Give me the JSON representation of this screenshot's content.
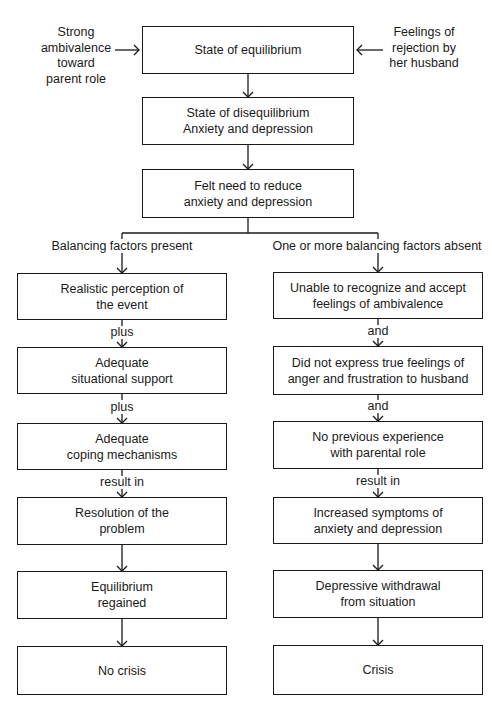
{
  "diagram": {
    "type": "flowchart",
    "colors": {
      "line": "#1a1a1a",
      "background": "#ffffff"
    },
    "inputs": {
      "left": [
        "Strong",
        "ambivalence",
        "toward",
        "parent role"
      ],
      "right": [
        "Feelings of",
        "rejection by",
        "her husband"
      ]
    },
    "main": [
      {
        "id": "equilibrium",
        "lines": [
          "State of equilibrium"
        ]
      },
      {
        "id": "disequilibrium",
        "lines": [
          "State of disequilibrium",
          "Anxiety and depression"
        ]
      },
      {
        "id": "felt-need",
        "lines": [
          "Felt need to reduce",
          "anxiety and depression"
        ]
      }
    ],
    "branches": {
      "left": {
        "label": "Balancing factors present",
        "boxes": [
          {
            "lines": [
              "Realistic perception of",
              "the event"
            ]
          },
          {
            "lines": [
              "Adequate",
              "situational support"
            ]
          },
          {
            "lines": [
              "Adequate",
              "coping mechanisms"
            ]
          },
          {
            "lines": [
              "Resolution of the",
              "problem"
            ]
          },
          {
            "lines": [
              "Equilibrium",
              "regained"
            ]
          },
          {
            "lines": [
              "No crisis"
            ]
          }
        ],
        "connectors": [
          "plus",
          "plus",
          "result in",
          "",
          ""
        ]
      },
      "right": {
        "label": "One or more balancing factors absent",
        "boxes": [
          {
            "lines": [
              "Unable to recognize and accept",
              "feelings of ambivalence"
            ]
          },
          {
            "lines": [
              "Did not express true feelings of",
              "anger and frustration to husband"
            ]
          },
          {
            "lines": [
              "No previous experience",
              "with parental role"
            ]
          },
          {
            "lines": [
              "Increased symptoms of",
              "anxiety and depression"
            ]
          },
          {
            "lines": [
              "Depressive withdrawal",
              "from situation"
            ]
          },
          {
            "lines": [
              "Crisis"
            ]
          }
        ],
        "connectors": [
          "and",
          "and",
          "result in",
          "",
          ""
        ]
      }
    }
  }
}
